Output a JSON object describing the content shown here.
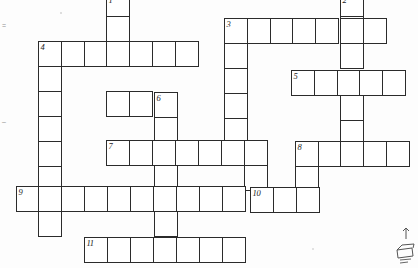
{
  "puzzle": {
    "title": "Crossword Puzzle Grid",
    "type": "blank-crossword",
    "cell_width": 22.6,
    "cell_height": 24.7,
    "origin_x": 16,
    "origin_y": 40,
    "border_color": "#2b2b2b",
    "cell_fill": "#ffffff",
    "background": "#fdfdfd",
    "grid_columns": 18,
    "grid_rows": 9,
    "clue_numbers": [
      "1",
      "2",
      "3",
      "4",
      "5",
      "6",
      "7",
      "8",
      "9",
      "10",
      "11"
    ],
    "entries": [
      {
        "number": "1",
        "direction": "down",
        "col": 4,
        "row": -1,
        "length": 6
      },
      {
        "number": "2",
        "direction": "down",
        "col": 14,
        "row": -1,
        "length": 8
      },
      {
        "number": "3",
        "direction": "across",
        "col": 9,
        "row": 0,
        "length": 7
      },
      {
        "number": "4",
        "direction": "across",
        "col": 1,
        "row": 1,
        "length": 7
      },
      {
        "number": "4",
        "direction": "down",
        "col": 1,
        "row": 1,
        "length": 8
      },
      {
        "number": "5",
        "direction": "across",
        "col": 12,
        "row": 2,
        "length": 5
      },
      {
        "number": "6",
        "direction": "down",
        "col": 6,
        "row": 3,
        "length": 7
      },
      {
        "number": "7",
        "direction": "across",
        "col": 4,
        "row": 5,
        "length": 7
      },
      {
        "number": "8",
        "direction": "across",
        "col": 12,
        "row": 5,
        "length": 5
      },
      {
        "number": "9",
        "direction": "across",
        "col": 0,
        "row": 7,
        "length": 10
      },
      {
        "number": "10",
        "direction": "across",
        "col": 10,
        "row": 7,
        "length": 3
      },
      {
        "number": "11",
        "direction": "across",
        "col": 3,
        "row": 9,
        "length": 7
      }
    ],
    "cells": [
      {
        "x": 106,
        "y": -6,
        "n": "1"
      },
      {
        "x": 106,
        "y": 16,
        "n": ""
      },
      {
        "x": 340,
        "y": -6,
        "n": "2"
      },
      {
        "x": 340,
        "y": 16,
        "n": ""
      },
      {
        "x": 224,
        "y": 18,
        "n": "3"
      },
      {
        "x": 247,
        "y": 18,
        "n": ""
      },
      {
        "x": 270,
        "y": 18,
        "n": ""
      },
      {
        "x": 292,
        "y": 18,
        "n": ""
      },
      {
        "x": 315,
        "y": 18,
        "n": ""
      },
      {
        "x": 340,
        "y": 18,
        "n": ""
      },
      {
        "x": 363,
        "y": 18,
        "n": ""
      },
      {
        "x": 38,
        "y": 41,
        "n": "4"
      },
      {
        "x": 61,
        "y": 41,
        "n": ""
      },
      {
        "x": 84,
        "y": 41,
        "n": ""
      },
      {
        "x": 106,
        "y": 41,
        "n": ""
      },
      {
        "x": 129,
        "y": 41,
        "n": ""
      },
      {
        "x": 152,
        "y": 41,
        "n": ""
      },
      {
        "x": 175,
        "y": 41,
        "n": ""
      },
      {
        "x": 224,
        "y": 43,
        "n": ""
      },
      {
        "x": 340,
        "y": 43,
        "n": ""
      },
      {
        "x": 38,
        "y": 66,
        "n": ""
      },
      {
        "x": 224,
        "y": 68,
        "n": ""
      },
      {
        "x": 291,
        "y": 70,
        "n": "5"
      },
      {
        "x": 314,
        "y": 70,
        "n": ""
      },
      {
        "x": 337,
        "y": 70,
        "n": ""
      },
      {
        "x": 359,
        "y": 70,
        "n": ""
      },
      {
        "x": 382,
        "y": 70,
        "n": ""
      },
      {
        "x": 38,
        "y": 91,
        "n": ""
      },
      {
        "x": 106,
        "y": 91,
        "n": ""
      },
      {
        "x": 129,
        "y": 91,
        "n": ""
      },
      {
        "x": 154,
        "y": 92,
        "n": "6"
      },
      {
        "x": 224,
        "y": 93,
        "n": ""
      },
      {
        "x": 340,
        "y": 95,
        "n": ""
      },
      {
        "x": 38,
        "y": 116,
        "n": ""
      },
      {
        "x": 154,
        "y": 117,
        "n": ""
      },
      {
        "x": 224,
        "y": 118,
        "n": ""
      },
      {
        "x": 340,
        "y": 120,
        "n": ""
      },
      {
        "x": 38,
        "y": 141,
        "n": ""
      },
      {
        "x": 106,
        "y": 140,
        "n": "7"
      },
      {
        "x": 129,
        "y": 140,
        "n": ""
      },
      {
        "x": 152,
        "y": 140,
        "n": ""
      },
      {
        "x": 175,
        "y": 140,
        "n": ""
      },
      {
        "x": 198,
        "y": 140,
        "n": ""
      },
      {
        "x": 221,
        "y": 140,
        "n": ""
      },
      {
        "x": 244,
        "y": 140,
        "n": ""
      },
      {
        "x": 295,
        "y": 141,
        "n": "8"
      },
      {
        "x": 318,
        "y": 141,
        "n": ""
      },
      {
        "x": 340,
        "y": 141,
        "n": ""
      },
      {
        "x": 363,
        "y": 141,
        "n": ""
      },
      {
        "x": 386,
        "y": 141,
        "n": ""
      },
      {
        "x": 38,
        "y": 166,
        "n": ""
      },
      {
        "x": 154,
        "y": 165,
        "n": ""
      },
      {
        "x": 244,
        "y": 165,
        "n": ""
      },
      {
        "x": 295,
        "y": 166,
        "n": ""
      },
      {
        "x": 16,
        "y": 186,
        "n": "9"
      },
      {
        "x": 38,
        "y": 186,
        "n": ""
      },
      {
        "x": 61,
        "y": 186,
        "n": ""
      },
      {
        "x": 84,
        "y": 186,
        "n": ""
      },
      {
        "x": 107,
        "y": 186,
        "n": ""
      },
      {
        "x": 130,
        "y": 186,
        "n": ""
      },
      {
        "x": 153,
        "y": 186,
        "n": ""
      },
      {
        "x": 176,
        "y": 186,
        "n": ""
      },
      {
        "x": 199,
        "y": 186,
        "n": ""
      },
      {
        "x": 222,
        "y": 186,
        "n": ""
      },
      {
        "x": 250,
        "y": 187,
        "n": "10"
      },
      {
        "x": 273,
        "y": 187,
        "n": ""
      },
      {
        "x": 296,
        "y": 187,
        "n": ""
      },
      {
        "x": 38,
        "y": 211,
        "n": ""
      },
      {
        "x": 154,
        "y": 211,
        "n": ""
      },
      {
        "x": 84,
        "y": 237,
        "n": "11"
      },
      {
        "x": 107,
        "y": 237,
        "n": ""
      },
      {
        "x": 130,
        "y": 237,
        "n": ""
      },
      {
        "x": 153,
        "y": 237,
        "n": ""
      },
      {
        "x": 176,
        "y": 237,
        "n": ""
      },
      {
        "x": 199,
        "y": 237,
        "n": ""
      },
      {
        "x": 222,
        "y": 237,
        "n": ""
      }
    ]
  },
  "margin_marks": [
    {
      "x": 2,
      "y": 22,
      "glyph": "="
    },
    {
      "x": 2,
      "y": 118,
      "glyph": "–"
    }
  ]
}
